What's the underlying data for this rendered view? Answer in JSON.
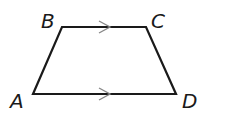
{
  "figure": {
    "type": "trapezoid",
    "vertices": {
      "A": {
        "label": "A",
        "x": 33,
        "y": 94
      },
      "B": {
        "label": "B",
        "x": 62,
        "y": 27
      },
      "C": {
        "label": "C",
        "x": 146,
        "y": 27
      },
      "D": {
        "label": "D",
        "x": 176,
        "y": 94
      }
    },
    "parallel_marks": [
      "BC",
      "AD"
    ],
    "stroke_color": "#1a1a1a",
    "arrow_color": "#888888"
  }
}
